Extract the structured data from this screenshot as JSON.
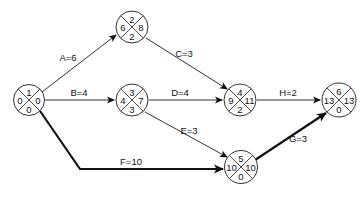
{
  "diagram": {
    "type": "activity-on-arrow network (critical path)",
    "nodes": [
      {
        "id": "1",
        "top": "1",
        "left": "0",
        "right": "0",
        "bottom": "0"
      },
      {
        "id": "2",
        "top": "2",
        "left": "6",
        "right": "8",
        "bottom": "2"
      },
      {
        "id": "3",
        "top": "3",
        "left": "4",
        "right": "7",
        "bottom": "3"
      },
      {
        "id": "4",
        "top": "4",
        "left": "9",
        "right": "11",
        "bottom": "2"
      },
      {
        "id": "5",
        "top": "5",
        "left": "10",
        "right": "10",
        "bottom": "0"
      },
      {
        "id": "6",
        "top": "6",
        "left": "13",
        "right": "13",
        "bottom": "0"
      }
    ],
    "edges": [
      {
        "label": "A=6",
        "from": "1",
        "to": "2",
        "critical": false
      },
      {
        "label": "B=4",
        "from": "1",
        "to": "3",
        "critical": false
      },
      {
        "label": "C=3",
        "from": "2",
        "to": "4",
        "critical": false
      },
      {
        "label": "D=4",
        "from": "3",
        "to": "4",
        "critical": false
      },
      {
        "label": "E=3",
        "from": "3",
        "to": "5",
        "critical": false
      },
      {
        "label": "F=10",
        "from": "1",
        "to": "5",
        "critical": true
      },
      {
        "label": "H=2",
        "from": "4",
        "to": "6",
        "critical": false
      },
      {
        "label": "G=3",
        "from": "5",
        "to": "6",
        "critical": true
      }
    ]
  },
  "colors": {
    "line": "#222222",
    "background": "#ffffff"
  }
}
